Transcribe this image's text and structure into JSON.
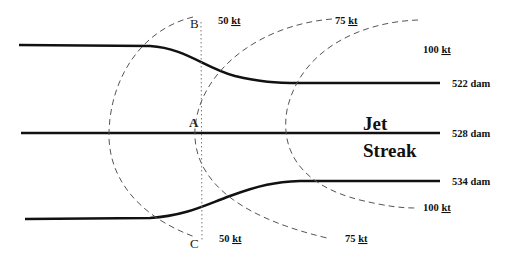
{
  "diagram": {
    "jet_label_line1": "Jet",
    "jet_label_line2": "Streak",
    "contours": [
      {
        "label": "522 dam"
      },
      {
        "label": "528 dam"
      },
      {
        "label": "534 dam"
      }
    ],
    "isotachs": {
      "top": [
        {
          "value": "50",
          "unit": "kt"
        },
        {
          "value": "75",
          "unit": "kt"
        },
        {
          "value": "100",
          "unit": "kt"
        }
      ],
      "bottom": [
        {
          "value": "50",
          "unit": "kt"
        },
        {
          "value": "75",
          "unit": "kt"
        },
        {
          "value": "100",
          "unit": "kt"
        }
      ]
    },
    "points": {
      "A": "A",
      "B": "B",
      "C": "C"
    },
    "colors": {
      "contour": "#111111",
      "isotach": "#555555",
      "cross_section": "#777777"
    }
  }
}
